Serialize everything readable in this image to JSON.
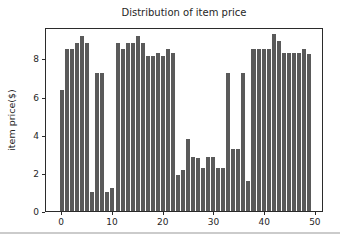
{
  "figure": {
    "background": "#ffffff",
    "divider_color": "#cbcbcb",
    "frame_color": "#2b2b2b",
    "text_color": "#262626"
  },
  "chart_data": {
    "type": "bar",
    "title": "Distribution of item price",
    "xlabel": "",
    "ylabel": "item price($)",
    "x": [
      0,
      1,
      2,
      3,
      4,
      5,
      6,
      7,
      8,
      9,
      10,
      11,
      12,
      13,
      14,
      15,
      16,
      17,
      18,
      19,
      20,
      21,
      22,
      23,
      24,
      25,
      26,
      27,
      28,
      29,
      30,
      31,
      32,
      33,
      34,
      35,
      36,
      37,
      38,
      39,
      40,
      41,
      42,
      43,
      44,
      45,
      46,
      47,
      48,
      49
    ],
    "values": [
      6.4,
      8.6,
      8.6,
      8.9,
      9.3,
      8.9,
      1.0,
      7.3,
      7.3,
      1.0,
      1.2,
      8.9,
      8.6,
      8.9,
      8.9,
      9.3,
      8.9,
      8.2,
      8.2,
      8.4,
      8.2,
      8.6,
      8.4,
      1.9,
      2.2,
      3.8,
      2.85,
      2.8,
      2.3,
      2.85,
      2.85,
      2.3,
      2.3,
      7.3,
      3.3,
      3.3,
      7.3,
      1.6,
      8.6,
      8.6,
      8.6,
      8.6,
      9.4,
      9.0,
      8.4,
      8.4,
      8.4,
      8.4,
      8.6,
      8.3
    ],
    "bar_color": "#5a5a5a",
    "bar_width": 0.8,
    "xlim": [
      -3.2,
      51.6
    ],
    "ylim": [
      0,
      9.65
    ],
    "xticks": [
      0,
      10,
      20,
      30,
      40,
      50
    ],
    "yticks": [
      0,
      2,
      4,
      6,
      8
    ],
    "grid": false,
    "legend": null
  }
}
